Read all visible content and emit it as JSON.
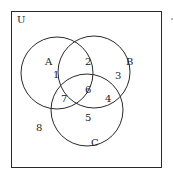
{
  "universe": {
    "label": "U"
  },
  "sets": [
    {
      "label": "A"
    },
    {
      "label": "B"
    },
    {
      "label": "C"
    }
  ],
  "regions": {
    "a_only": "1",
    "a_and_b_only": "2",
    "b_only": "3",
    "b_and_c_only": "4",
    "c_only": "5",
    "a_b_c": "6",
    "a_and_c_only": "7",
    "outside": "8"
  },
  "colors": {
    "stroke": "#2a2a2a",
    "background": "#ffffff"
  }
}
